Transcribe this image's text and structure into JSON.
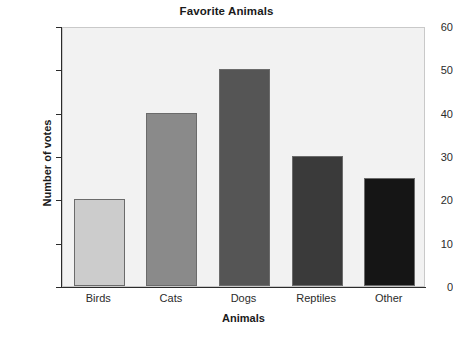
{
  "chart_data": {
    "type": "bar",
    "title": "Favorite Animals",
    "xlabel": "Animals",
    "ylabel": "Number of votes",
    "categories": [
      "Birds",
      "Cats",
      "Dogs",
      "Reptiles",
      "Other"
    ],
    "values": [
      20,
      40,
      50,
      30,
      25
    ],
    "bar_colors": [
      "#cccccc",
      "#8a8a8a",
      "#555555",
      "#3a3a3a",
      "#151515"
    ],
    "bar_edge_color": "#6b6b6b",
    "ylim": [
      0,
      60
    ],
    "ytick_labels": [
      "0",
      "10",
      "20",
      "30",
      "40",
      "50",
      "60"
    ],
    "ytick_values": [
      0,
      10,
      20,
      30,
      40,
      50,
      60
    ],
    "grid": false,
    "legend": "none",
    "plot_background": "#f2f2f2",
    "figure_background": "#ffffff",
    "axis_color": "#2b2b2b"
  }
}
